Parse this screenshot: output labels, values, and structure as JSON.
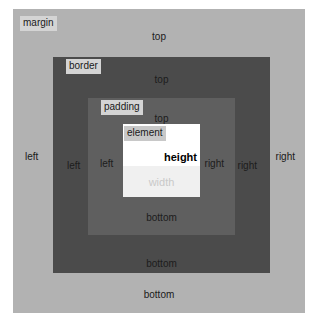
{
  "diagram": {
    "colors": {
      "page_background": "#ffffff",
      "margin_fill": "#b2b2b2",
      "border_fill": "#4b4b4b",
      "padding_fill": "#5f5f5f",
      "element_fill": "#ffffff",
      "element_fill_lower": "#f0f0f0",
      "chip_background": "#d4d4d4",
      "label_text": "#1a1a1a",
      "width_label_text": "#c9c9c9",
      "height_label_text": "#000000"
    }
  },
  "margin": {
    "name": "margin",
    "top": "top",
    "bottom": "bottom",
    "left": "left",
    "right": "right"
  },
  "border": {
    "name": "border",
    "top": "top",
    "bottom": "bottom",
    "left": "left",
    "right": "right"
  },
  "padding": {
    "name": "padding",
    "top": "top",
    "bottom": "bottom",
    "left": "left",
    "right": "right"
  },
  "element": {
    "name": "element",
    "height": "height",
    "width": "width"
  }
}
